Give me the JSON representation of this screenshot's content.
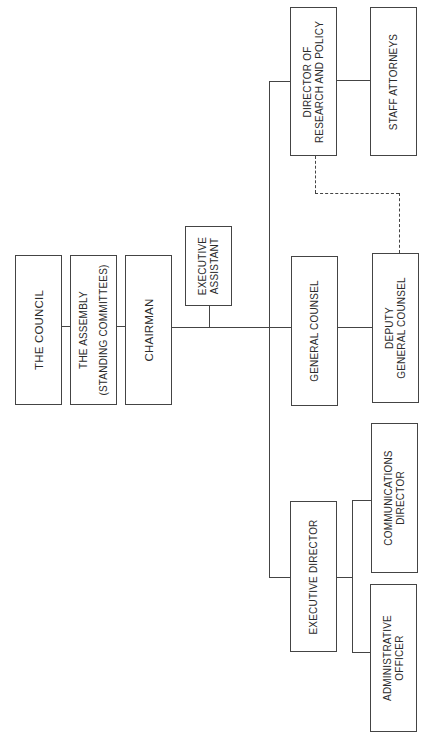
{
  "diagram": {
    "type": "org-chart",
    "orientation": "rotated-90-ccw",
    "nodes": {
      "council": {
        "lines": [
          "THE COUNCIL"
        ]
      },
      "assembly": {
        "lines": [
          "THE ASSEMBLY",
          "(STANDING COMMITTEES)"
        ]
      },
      "chairman": {
        "lines": [
          "CHAIRMAN"
        ]
      },
      "executive_assistant": {
        "lines": [
          "EXECUTIVE",
          "ASSISTANT"
        ]
      },
      "director_research": {
        "lines": [
          "DIRECTOR OF",
          "RESEARCH AND POLICY"
        ]
      },
      "staff_attorneys": {
        "lines": [
          "STAFF ATTORNEYS"
        ]
      },
      "general_counsel": {
        "lines": [
          "GENERAL COUNSEL"
        ]
      },
      "deputy_general_counsel": {
        "lines": [
          "DEPUTY",
          "GENERAL COUNSEL"
        ]
      },
      "executive_director": {
        "lines": [
          "EXECUTIVE DIRECTOR"
        ]
      },
      "communications_director": {
        "lines": [
          "COMMUNICATIONS",
          "DIRECTOR"
        ]
      },
      "administrative_officer": {
        "lines": [
          "ADMINISTRATIVE",
          "OFFICER"
        ]
      }
    },
    "edges": [
      {
        "from": "council",
        "to": "assembly",
        "style": "solid"
      },
      {
        "from": "assembly",
        "to": "chairman",
        "style": "solid"
      },
      {
        "from": "chairman",
        "to": "executive_assistant",
        "style": "solid"
      },
      {
        "from": "chairman",
        "to": "director_research",
        "style": "solid"
      },
      {
        "from": "chairman",
        "to": "general_counsel",
        "style": "solid"
      },
      {
        "from": "chairman",
        "to": "executive_director",
        "style": "solid"
      },
      {
        "from": "director_research",
        "to": "staff_attorneys",
        "style": "solid"
      },
      {
        "from": "general_counsel",
        "to": "deputy_general_counsel",
        "style": "solid"
      },
      {
        "from": "executive_director",
        "to": "communications_director",
        "style": "solid"
      },
      {
        "from": "executive_director",
        "to": "administrative_officer",
        "style": "solid"
      },
      {
        "from": "director_research",
        "to": "deputy_general_counsel",
        "style": "dashed"
      }
    ],
    "colors": {
      "line": "#444444",
      "text": "#2a2a2a",
      "background": "#ffffff"
    }
  }
}
